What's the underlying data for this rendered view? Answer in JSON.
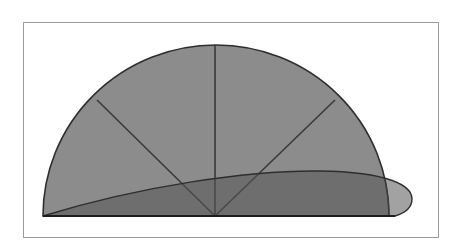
{
  "diagram": {
    "type": "geometric-figure",
    "colors": {
      "frame_border": "#9a9a9a",
      "semicircle_fill": "#8c8c8c",
      "ellipse_fill": "#6e6e6e",
      "stroke": "#2e2e2e",
      "background": "#ffffff"
    },
    "semicircle": {
      "center": [
        215,
        216
      ],
      "radius_x": 173,
      "radius_y": 171
    },
    "rays": [
      {
        "from": [
          215,
          216
        ],
        "to": [
          97,
          100
        ]
      },
      {
        "from": [
          215,
          216
        ],
        "to": [
          215,
          45
        ]
      },
      {
        "from": [
          215,
          216
        ],
        "to": [
          335,
          100
        ]
      }
    ],
    "lobe": {
      "start": [
        43,
        216
      ],
      "peak": [
        300,
        170
      ],
      "tip": [
        412,
        199
      ],
      "end": [
        395,
        216
      ]
    }
  }
}
